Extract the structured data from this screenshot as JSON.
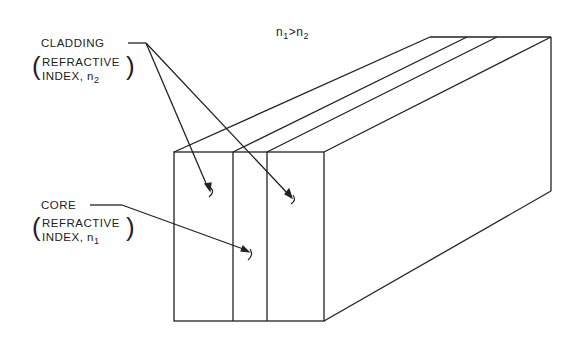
{
  "figure": {
    "condition": {
      "base": "n",
      "sub1": "1",
      "op": ">",
      "sub2": "2"
    },
    "cladding": {
      "title": "CLADDING",
      "line2": "REFRACTIVE",
      "line3_prefix": "INDEX, n",
      "line3_sub": "2"
    },
    "core": {
      "title": "CORE",
      "line2": "REFRACTIVE",
      "line3_prefix": "INDEX, n",
      "line3_sub": "1"
    },
    "colors": {
      "line": "#222222",
      "background": "#ffffff"
    }
  }
}
